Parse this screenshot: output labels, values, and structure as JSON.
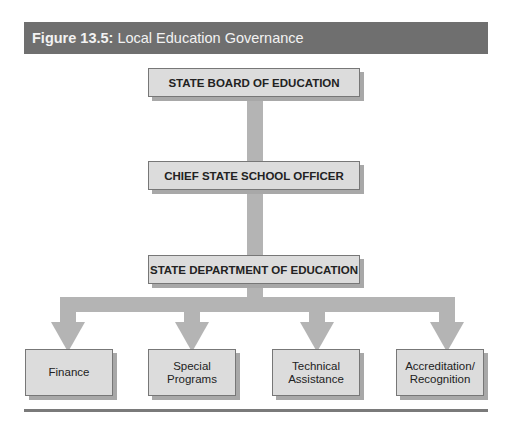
{
  "figure": {
    "label": "Figure 13.5:",
    "title": "Local Education Governance"
  },
  "hierarchy": {
    "level1": "STATE BOARD OF EDUCATION",
    "level2": "CHIEF STATE SCHOOL OFFICER",
    "level3": "STATE DEPARTMENT OF EDUCATION",
    "divisions": [
      {
        "line1": "Finance",
        "line2": ""
      },
      {
        "line1": "Special",
        "line2": "Programs"
      },
      {
        "line1": "Technical",
        "line2": "Assistance"
      },
      {
        "line1": "Accreditation/",
        "line2": "Recognition"
      }
    ]
  },
  "colors": {
    "header_bg": "#6f6f6f",
    "box_fill": "#dcdcdc",
    "connector": "#b4b4b4"
  }
}
